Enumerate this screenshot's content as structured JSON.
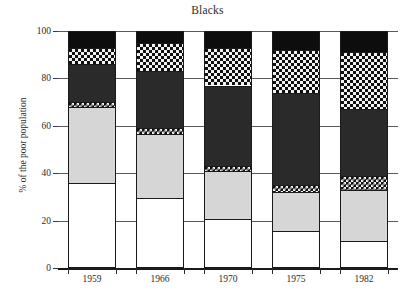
{
  "chart_data": {
    "type": "bar",
    "subtype": "stacked-bar",
    "title": "Blacks",
    "xlabel": "",
    "ylabel": "% of the poor population",
    "ylim": [
      0,
      100
    ],
    "yticks": [
      0,
      20,
      40,
      60,
      80,
      100
    ],
    "ytick_labels": [
      "0",
      "20",
      "40",
      "60",
      "80",
      "100"
    ],
    "grid": true,
    "legend": "none",
    "categories": [
      "1959",
      "1966",
      "1970",
      "1975",
      "1982"
    ],
    "series": [
      {
        "name": "segment-1-white",
        "fill": "white",
        "values": [
          36,
          29.5,
          20.5,
          15.5,
          11.5
        ]
      },
      {
        "name": "segment-2-light-gray",
        "fill": "light-gray",
        "values": [
          32,
          27,
          20.5,
          16.5,
          21.5
        ]
      },
      {
        "name": "segment-3-checker-thin",
        "fill": "checker",
        "values": [
          2,
          2.5,
          2,
          3,
          6
        ]
      },
      {
        "name": "segment-4-dark-gray",
        "fill": "dark-gray",
        "values": [
          16,
          24,
          34,
          39,
          28
        ]
      },
      {
        "name": "segment-5-checker",
        "fill": "checker",
        "values": [
          7,
          12,
          16,
          18,
          24
        ]
      },
      {
        "name": "segment-6-black",
        "fill": "black",
        "values": [
          7,
          5,
          7,
          8,
          9
        ]
      }
    ],
    "cumulative_tops": {
      "1959": [
        36,
        68,
        70,
        86,
        93,
        100
      ],
      "1966": [
        29.5,
        56.5,
        59,
        83,
        95,
        100
      ],
      "1970": [
        20.5,
        41,
        43,
        77,
        93,
        100
      ],
      "1975": [
        15.5,
        32,
        35,
        74,
        92,
        100
      ],
      "1982": [
        11.5,
        33,
        39,
        67,
        91,
        100
      ]
    },
    "colors": {
      "white": "#ffffff",
      "light-gray": "#d6d6d6",
      "dark-gray": "#2a2a2a",
      "black": "#0d0d0d",
      "checker-dark": "#101010",
      "checker-light": "#f2f2f2",
      "axis": "#1a1a1a",
      "gridline": "#5a5a5a",
      "text": "#2b2b2b"
    }
  }
}
